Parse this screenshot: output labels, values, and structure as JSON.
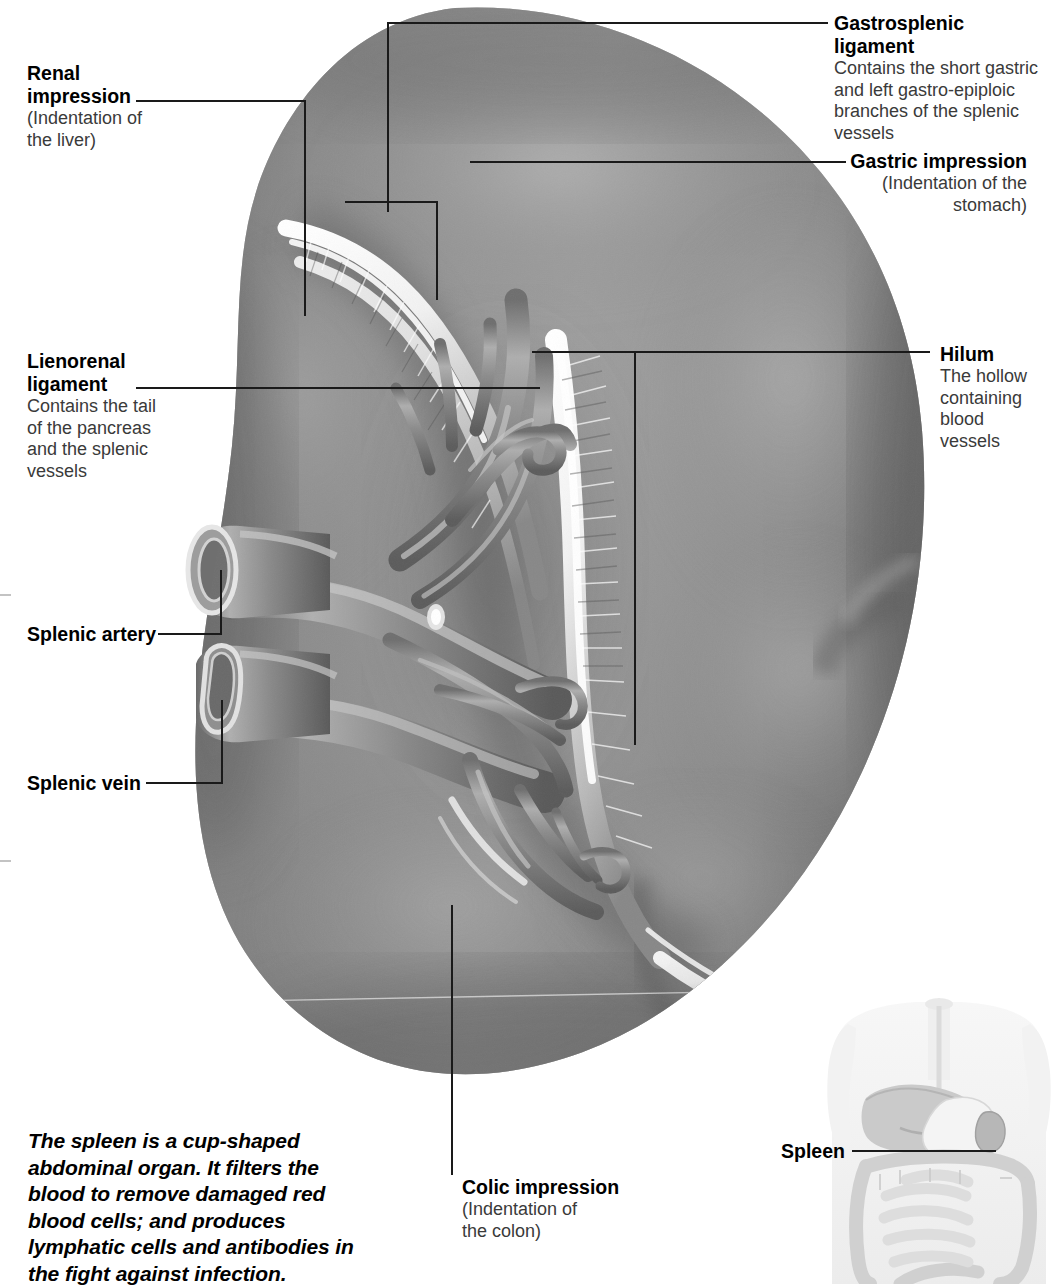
{
  "figure": {
    "subject": "Spleen",
    "view": "Visceral (medial) surface of the spleen",
    "background_color": "#ffffff",
    "organ_color": "#8a8a8a"
  },
  "labels": [
    {
      "id": "renal-impression",
      "title": "Renal",
      "title2": "impression",
      "sub": [
        "(Indentation of",
        "the liver)"
      ],
      "side": "left"
    },
    {
      "id": "lienorenal-ligament",
      "title": "Lienorenal",
      "title2": "ligament",
      "sub": [
        "Contains the tail",
        "of the pancreas",
        "and the splenic",
        "vessels"
      ],
      "side": "left"
    },
    {
      "id": "splenic-artery",
      "title": "Splenic artery",
      "sub": [],
      "side": "left"
    },
    {
      "id": "splenic-vein",
      "title": "Splenic vein",
      "sub": [],
      "side": "left"
    },
    {
      "id": "gastrosplenic-ligament",
      "title": "Gastrosplenic ligament",
      "sub": [
        "Contains the short gastric",
        "and left gastro-epiploic",
        "branches of the splenic",
        "vessels"
      ],
      "side": "right"
    },
    {
      "id": "gastric-impression",
      "title": "Gastric impression",
      "sub": [
        "(Indentation of the",
        "stomach)"
      ],
      "side": "right"
    },
    {
      "id": "hilum",
      "title": "Hilum",
      "sub": [
        "The hollow",
        "containing",
        "blood",
        "vessels"
      ],
      "side": "right"
    },
    {
      "id": "colic-impression",
      "title": "Colic impression",
      "sub": [
        "(Indentation of",
        "the colon)"
      ],
      "side": "bottom"
    },
    {
      "id": "spleen-locator",
      "title": "Spleen",
      "sub": [],
      "side": "bottom-right"
    }
  ],
  "caption": {
    "lines": [
      "The spleen is a cup-shaped",
      "abdominal organ. It filters the",
      "blood to remove damaged red",
      "blood cells; and produces",
      "lymphatic cells and antibodies in",
      "the fight against infection."
    ]
  },
  "locator": {
    "label": "Spleen",
    "description": "Faint grayscale torso showing liver, stomach, spleen and intestines"
  }
}
